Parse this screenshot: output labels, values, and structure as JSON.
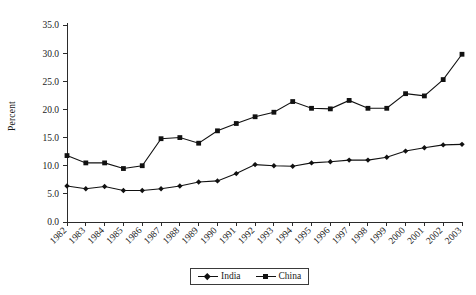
{
  "chart_data": {
    "type": "line",
    "title": "",
    "xlabel": "",
    "ylabel": "Percent",
    "ylim": [
      0,
      35
    ],
    "ytick_step": 5,
    "grid": false,
    "legend_position": "bottom-center",
    "categories": [
      "1982",
      "1983",
      "1984",
      "1985",
      "1986",
      "1987",
      "1988",
      "1989",
      "1990",
      "1991",
      "1992",
      "1993",
      "1994",
      "1995",
      "1996",
      "1997",
      "1998",
      "1999",
      "2000",
      "2001",
      "2002",
      "2003"
    ],
    "ytick_labels": [
      "0.0",
      "5.0",
      "10.0",
      "15.0",
      "20.0",
      "25.0",
      "30.0",
      "35.0"
    ],
    "series": [
      {
        "name": "India",
        "marker": "diamond",
        "color": "#111111",
        "values": [
          6.4,
          5.9,
          6.3,
          5.6,
          5.6,
          5.9,
          6.4,
          7.1,
          7.3,
          8.6,
          10.2,
          10.0,
          9.9,
          10.5,
          10.7,
          11.0,
          11.0,
          11.5,
          12.6,
          13.2,
          13.7,
          13.8
        ]
      },
      {
        "name": "China",
        "marker": "square",
        "color": "#111111",
        "values": [
          11.8,
          10.5,
          10.5,
          9.5,
          10.0,
          14.8,
          15.0,
          14.0,
          16.2,
          17.5,
          18.7,
          19.5,
          21.4,
          20.2,
          20.1,
          21.6,
          20.2,
          20.2,
          22.8,
          22.4,
          25.3,
          29.8
        ]
      }
    ]
  },
  "legend": {
    "entries": [
      {
        "label": "India",
        "marker": "diamond"
      },
      {
        "label": "China",
        "marker": "square"
      }
    ]
  }
}
